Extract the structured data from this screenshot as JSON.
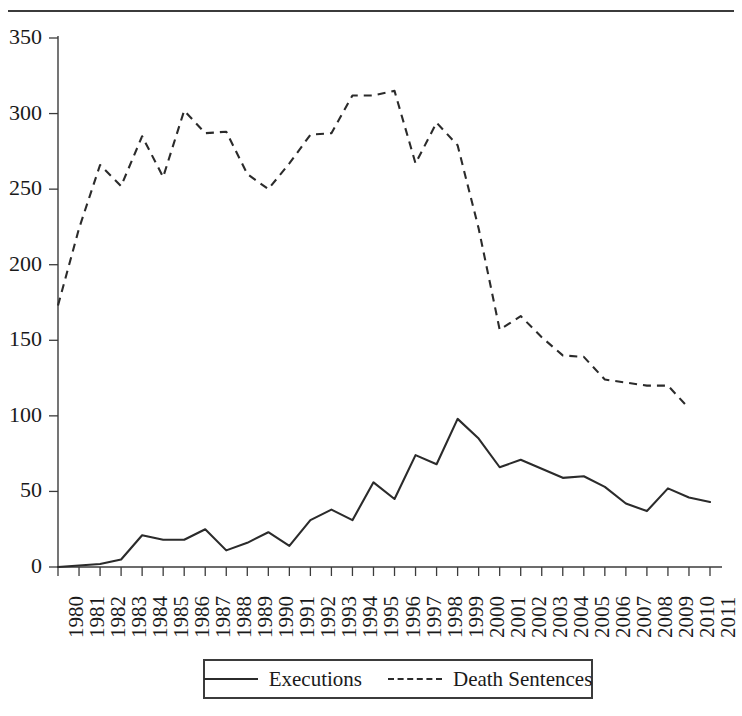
{
  "chart_data": {
    "type": "line",
    "title": "",
    "xlabel": "",
    "ylabel": "",
    "grid": false,
    "legend_position": "bottom",
    "ylim": [
      0,
      350
    ],
    "ytick_values": [
      0,
      50,
      100,
      150,
      200,
      250,
      300,
      350
    ],
    "ytick_labels": [
      "0",
      "50",
      "100",
      "150",
      "200",
      "250",
      "300",
      "350"
    ],
    "categories": [
      "1980",
      "1981",
      "1982",
      "1983",
      "1984",
      "1985",
      "1986",
      "1987",
      "1988",
      "1989",
      "1990",
      "1991",
      "1992",
      "1993",
      "1994",
      "1995",
      "1996",
      "1997",
      "1998",
      "1999",
      "2000",
      "2001",
      "2002",
      "2003",
      "2004",
      "2005",
      "2006",
      "2007",
      "2008",
      "2009",
      "2010",
      "2011"
    ],
    "series": [
      {
        "name": "Executions",
        "style": "solid",
        "color": "#2b2b2b",
        "values": [
          0,
          1,
          2,
          5,
          21,
          18,
          18,
          25,
          11,
          16,
          23,
          14,
          31,
          38,
          31,
          56,
          45,
          74,
          68,
          98,
          85,
          66,
          71,
          65,
          59,
          60,
          53,
          42,
          37,
          52,
          46,
          43
        ]
      },
      {
        "name": "Death Sentences",
        "style": "dashed",
        "color": "#2b2b2b",
        "values": [
          173,
          224,
          266,
          252,
          285,
          258,
          302,
          287,
          288,
          260,
          250,
          267,
          286,
          287,
          312,
          312,
          315,
          267,
          294,
          279,
          224,
          157,
          166,
          152,
          140,
          139,
          124,
          122,
          120,
          120,
          105,
          null
        ]
      }
    ]
  },
  "legend": {
    "entries": [
      {
        "label": "Executions",
        "style": "solid"
      },
      {
        "label": "Death Sentences",
        "style": "dashed"
      }
    ]
  }
}
